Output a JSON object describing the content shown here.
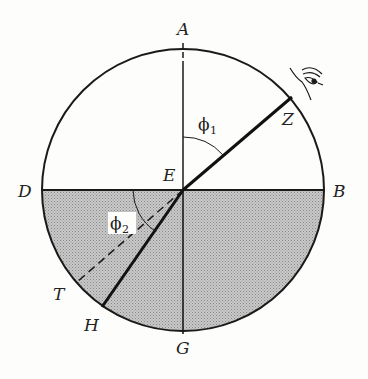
{
  "diagram": {
    "points": {
      "A": "A",
      "B": "B",
      "D": "D",
      "E": "E",
      "G": "G",
      "H": "H",
      "T": "T",
      "Z": "Z"
    },
    "angles": {
      "phi1": {
        "symbol": "ϕ",
        "sub": "1"
      },
      "phi2": {
        "symbol": "ϕ",
        "sub": "2"
      }
    },
    "icons": [
      "eye-icon"
    ],
    "colors": {
      "stroke": "#1a1a1a",
      "shade": "#b9b9b9",
      "background": "#fdfdfb"
    }
  }
}
